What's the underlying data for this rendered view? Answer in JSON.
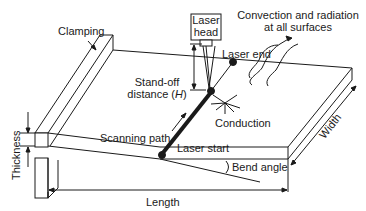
{
  "diagram": {
    "labels": {
      "clamping": "Clamping",
      "laser_head_line1": "Laser",
      "laser_head_line2": "head",
      "convection_line1": "Convection and radiation",
      "convection_line2": "at all surfaces",
      "laser_end": "Laser end",
      "standoff_line1": "Stand-off",
      "standoff_line2_prefix": "distance (",
      "standoff_symbol": "H",
      "standoff_line2_suffix": ")",
      "conduction": "Conduction",
      "thickness": "Thickness",
      "scanning_path": "Scanning path",
      "laser_start": "Laser start",
      "width": "Width",
      "bend_angle": "Bend angle",
      "length": "Length"
    },
    "colors": {
      "stroke": "#1a1a1a",
      "background": "#ffffff"
    }
  }
}
